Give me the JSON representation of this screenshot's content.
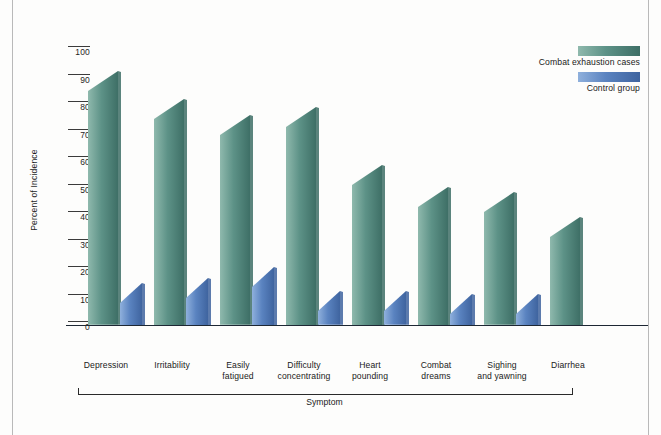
{
  "chart_data": {
    "type": "bar",
    "title": "",
    "xlabel": "Symptom",
    "ylabel": "Percent of Incidence",
    "ylim": [
      0,
      100
    ],
    "ytick_labels": [
      "0",
      "10",
      "20",
      "30",
      "40",
      "50",
      "60",
      "70",
      "80",
      "90",
      "100"
    ],
    "ytick_values": [
      0,
      10,
      20,
      30,
      40,
      50,
      60,
      70,
      80,
      90,
      100
    ],
    "grid": false,
    "legend_position": "top-right",
    "categories": [
      "Depression",
      "Irritability",
      "Easily fatigued",
      "Difficulty concentrating",
      "Heart pounding",
      "Combat dreams",
      "Sighing and yawning",
      "Diarrhea"
    ],
    "category_lines": [
      [
        "Depression"
      ],
      [
        "Irritability"
      ],
      [
        "Easily",
        "fatigued"
      ],
      [
        "Difficulty",
        "concentrating"
      ],
      [
        "Heart",
        "pounding"
      ],
      [
        "Combat",
        "dreams"
      ],
      [
        "Sighing",
        "and yawning"
      ],
      [
        "Diarrhea"
      ]
    ],
    "series": [
      {
        "name": "Combat exhaustion cases",
        "color": "#5d9287",
        "color_light": "#8fb9ad",
        "color_dark": "#3e6f66",
        "values": [
          85,
          75,
          69,
          72,
          51,
          43,
          41,
          32
        ]
      },
      {
        "name": "Control group",
        "color": "#5a83c0",
        "color_light": "#8fb0dc",
        "color_dark": "#3f649f",
        "values": [
          8,
          10,
          14,
          5,
          5,
          4,
          4,
          0
        ]
      }
    ]
  },
  "legend": {
    "items": [
      {
        "label": "Combat exhaustion cases",
        "color": "#5d9287"
      },
      {
        "label": "Control group",
        "color": "#5a83c0"
      }
    ]
  },
  "axes": {
    "y_title": "Percent of Incidence",
    "x_title": "Symptom"
  }
}
